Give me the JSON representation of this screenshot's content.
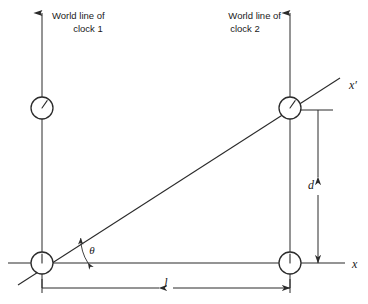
{
  "figure": {
    "background_color": "#ffffff",
    "line_color": "#2b2b2b",
    "width": 368,
    "height": 304
  },
  "labels": {
    "worldline_1_line1": "World line of",
    "worldline_1_line2": "clock 1",
    "worldline_2_line1": "World line of",
    "worldline_2_line2": "clock 2",
    "x_axis": "x",
    "x_prime_axis": "x′",
    "angle": "θ",
    "distance_d": "d",
    "length_l": "l"
  },
  "chart_data": {
    "type": "diagram",
    "axes": [
      {
        "name": "x",
        "label": "x",
        "from": [
          8,
          263
        ],
        "to": [
          345,
          263
        ],
        "label_pos": [
          352,
          265
        ]
      },
      {
        "name": "x-prime",
        "label": "x′",
        "from": [
          18,
          285
        ],
        "to": [
          340,
          78
        ],
        "label_pos": [
          349,
          86
        ]
      }
    ],
    "worldlines": [
      {
        "name": "clock-1",
        "label_line1": "World line of",
        "label_line2": "clock 1",
        "x": 42,
        "y_top": 13,
        "y_bottom": 288,
        "arrow": "up",
        "label_anchor": "start",
        "label_x": 52,
        "label_y1": 16,
        "label_y2": 29
      },
      {
        "name": "clock-2",
        "label_line1": "World line of",
        "label_line2": "clock 2",
        "x": 290,
        "y_top": 13,
        "y_bottom": 288,
        "arrow": "up",
        "label_anchor": "end",
        "label_x": 281,
        "label_y1": 16,
        "label_y2": 29
      }
    ],
    "clocks": [
      {
        "name": "clock-1-later",
        "cx": 42,
        "cy": 108,
        "r": 11,
        "hand_angle_deg": 35,
        "hand_len": 9
      },
      {
        "name": "clock-2-later",
        "cx": 290,
        "cy": 108,
        "r": 11,
        "hand_angle_deg": 35,
        "hand_len": 9
      },
      {
        "name": "clock-1-origin",
        "cx": 42,
        "cy": 263,
        "r": 11,
        "hand_angle_deg": 0,
        "hand_len": 9
      },
      {
        "name": "clock-2-origin",
        "cx": 290,
        "cy": 263,
        "r": 11,
        "hand_angle_deg": 0,
        "hand_len": 9
      }
    ],
    "dimensions": [
      {
        "name": "d",
        "label": "d",
        "orientation": "vertical",
        "x": 318,
        "y_from": 110,
        "y_to": 263,
        "tick_from": [
          300,
          110
        ],
        "tick_to": [
          333,
          110
        ],
        "label_pos": [
          311,
          186
        ]
      },
      {
        "name": "l",
        "label": "l",
        "orientation": "horizontal",
        "y": 288,
        "x_from": 42,
        "x_to": 290,
        "label_pos": [
          166,
          284
        ]
      }
    ],
    "angle_marker": {
      "name": "theta",
      "label": "θ",
      "vertex": [
        42,
        263
      ],
      "radius": 46,
      "start_deg": 0,
      "end_deg": 32.7,
      "label_pos": [
        92,
        251
      ]
    }
  }
}
